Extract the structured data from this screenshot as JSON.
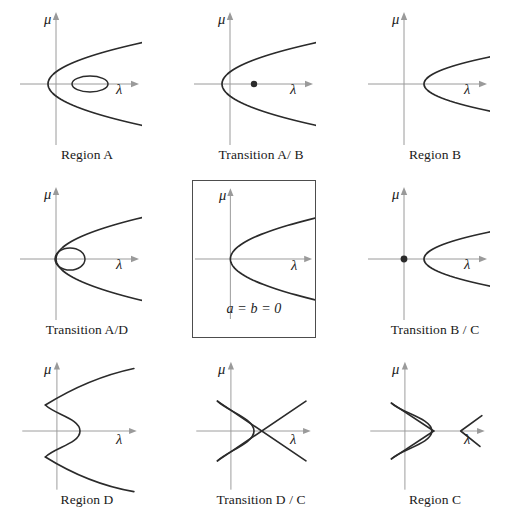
{
  "figure": {
    "type": "diagram",
    "axis_color": "#9a9a9a",
    "curve_color": "#2b2b2b",
    "background": "#ffffff",
    "rows": 3,
    "columns": 3
  },
  "axes": {
    "x_label": "λ",
    "y_label": "μ",
    "origin_x": 38,
    "origin_y": 79
  },
  "panels": [
    {
      "id": "region-a",
      "caption": "Region A",
      "boxed": false,
      "features": [
        "parabola-open-right-wide",
        "ellipse-on-x-axis"
      ],
      "parabola": {
        "vertex_x": 30,
        "opening": "right",
        "width_k": 0.055
      },
      "ellipse": {
        "cx": 72,
        "cy": 79,
        "rx": 18,
        "ry": 8
      },
      "dots": []
    },
    {
      "id": "transition-a-b",
      "caption": "Transition A/ B",
      "boxed": false,
      "features": [
        "parabola-open-right-wide",
        "point-on-x-axis"
      ],
      "parabola": {
        "vertex_x": 30,
        "opening": "right",
        "width_k": 0.055
      },
      "ellipse": null,
      "dots": [
        {
          "x": 62,
          "y": 79,
          "r": 3.2
        }
      ]
    },
    {
      "id": "region-b",
      "caption": "Region B",
      "boxed": false,
      "features": [
        "parabola-open-right-narrow"
      ],
      "parabola": {
        "vertex_x": 58,
        "opening": "right",
        "width_k": 0.09
      },
      "ellipse": null,
      "dots": []
    },
    {
      "id": "transition-a-d",
      "caption": "Transition A/D",
      "boxed": false,
      "features": [
        "parabola-open-right-vertex-at-origin",
        "ellipse-touching-origin"
      ],
      "parabola": {
        "vertex_x": 38,
        "opening": "right",
        "width_k": 0.05
      },
      "ellipse": {
        "cx": 52,
        "cy": 79,
        "rx": 15,
        "ry": 11
      },
      "dots": []
    },
    {
      "id": "a-b-zero",
      "caption": "a = b = 0",
      "boxed": true,
      "features": [
        "parabola-open-right-vertex-at-origin"
      ],
      "parabola": {
        "vertex_x": 38,
        "opening": "right",
        "width_k": 0.05
      },
      "ellipse": null,
      "dots": []
    },
    {
      "id": "transition-b-c",
      "caption": "Transition B / C",
      "boxed": false,
      "features": [
        "parabola-open-right-narrow",
        "point-at-origin"
      ],
      "parabola": {
        "vertex_x": 58,
        "opening": "right",
        "width_k": 0.09
      },
      "ellipse": null,
      "dots": [
        {
          "x": 38,
          "y": 79,
          "r": 3.4
        }
      ]
    },
    {
      "id": "region-d",
      "caption": "Region D",
      "boxed": false,
      "features": [
        "cusp-arc-open-right",
        "two-straight-branches"
      ],
      "cusp": {
        "tip_x": 62,
        "upper_y": 52,
        "lower_y": 106,
        "corner_x": 26
      },
      "dots": []
    },
    {
      "id": "transition-d-c",
      "caption": "Transition D / C",
      "boxed": false,
      "features": [
        "cusp-arc",
        "crossing-straight-lines"
      ],
      "cusp": {
        "tip_x": 62,
        "upper_y": 48,
        "lower_y": 110,
        "corner_x": 24
      },
      "crossing": {
        "x": 78,
        "y": 79
      },
      "dots": []
    },
    {
      "id": "region-c",
      "caption": "Region C",
      "boxed": false,
      "features": [
        "closed-cusped-triangle",
        "detached-left-pointing-wedge"
      ],
      "cusp": {
        "tip_x": 66,
        "upper_y": 50,
        "lower_y": 108,
        "corner_x": 24
      },
      "wedge": {
        "tip_x": 96,
        "tip_y": 79,
        "spread": 16
      },
      "dots": []
    }
  ]
}
